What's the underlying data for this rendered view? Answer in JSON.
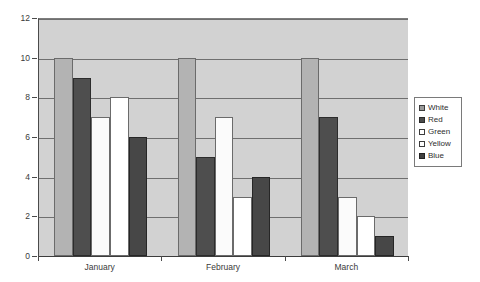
{
  "chart_data": {
    "type": "bar",
    "title": "",
    "xlabel": "",
    "ylabel": "",
    "categories": [
      "January",
      "February",
      "March"
    ],
    "series": [
      {
        "name": "White",
        "color": "#b3b3b3",
        "values": [
          10,
          10,
          10
        ]
      },
      {
        "name": "Red",
        "color": "#4e4e4e",
        "values": [
          9,
          5,
          7
        ]
      },
      {
        "name": "Green",
        "color": "#fbfbfb",
        "values": [
          7,
          7,
          3
        ]
      },
      {
        "name": "Yellow",
        "color": "#ffffff",
        "values": [
          8,
          3,
          2
        ]
      },
      {
        "name": "Blue",
        "color": "#474747",
        "values": [
          6,
          4,
          1
        ]
      }
    ],
    "ylim": [
      0,
      12
    ],
    "yticks": [
      0,
      2,
      4,
      6,
      8,
      10,
      12
    ],
    "ytick_labels": [
      "0",
      "2",
      "4",
      "6",
      "8",
      "10",
      "12"
    ],
    "grid": true,
    "legend_position": "right",
    "plot_background": "#d2d2d2"
  }
}
